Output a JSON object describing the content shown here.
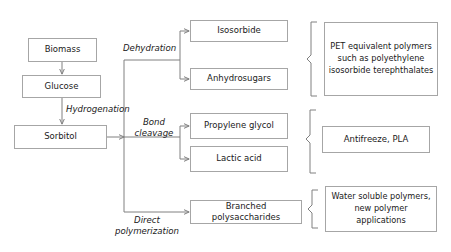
{
  "diagram": {
    "line_color": "#808080",
    "box_border_color": "#a6a6a6",
    "text_color": "#1a1a1a",
    "background": "#ffffff"
  },
  "feedstock": {
    "biomass": "Biomass",
    "glucose": "Glucose",
    "sorbitol": "Sorbitol"
  },
  "process_labels": {
    "hydrogenation": "Hydrogenation",
    "dehydration": "Dehydration",
    "bond_cleavage_line1": "Bond",
    "bond_cleavage_line2": "cleavage",
    "direct_polymerization_line1": "Direct",
    "direct_polymerization_line2": "polymerization"
  },
  "intermediates": {
    "isosorbide": "Isosorbide",
    "anhydrosugars": "Anhydrosugars",
    "propylene_glycol": "Propylene glycol",
    "lactic_acid": "Lactic acid",
    "branched_polysaccharides": "Branched polysaccharides"
  },
  "applications": {
    "pet_polymers": "PET equivalent polymers such as polyethylene isosorbide terephthalates",
    "antifreeze_pla": "Antifreeze, PLA",
    "water_soluble": "Water soluble polymers, new polymer applications"
  }
}
